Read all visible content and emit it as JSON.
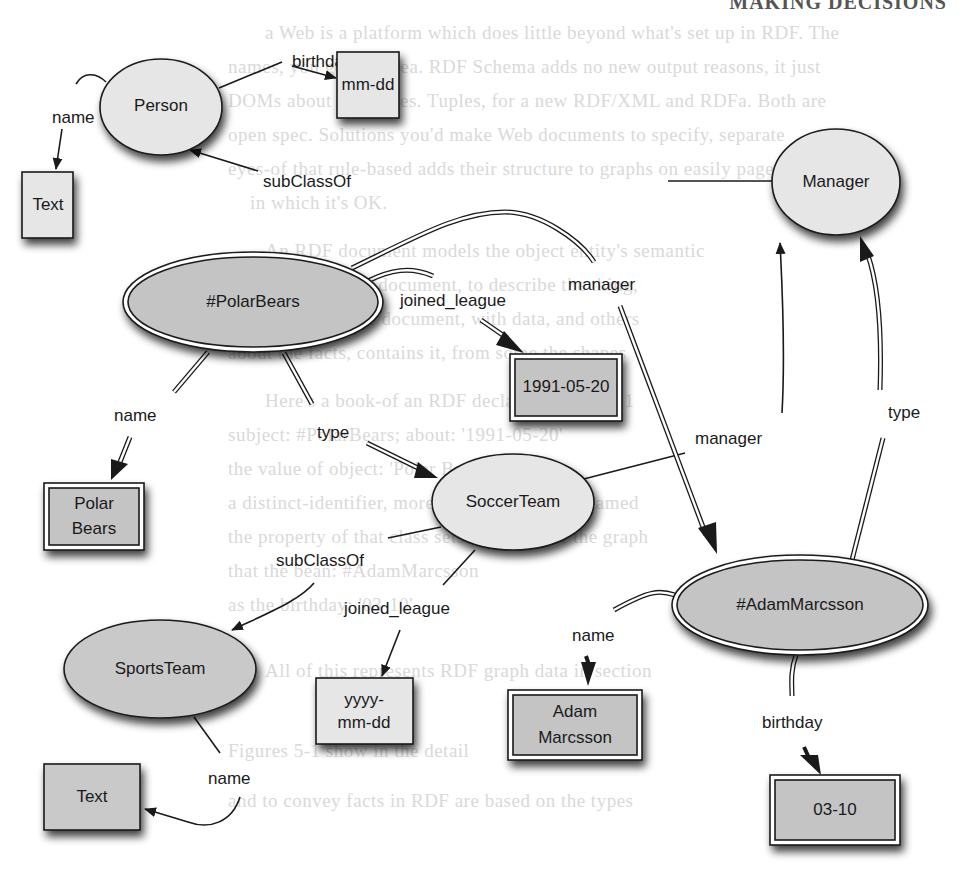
{
  "page": {
    "header_fragment": "MAKING DECISIONS",
    "background_lines": [
      "a Web is a platform which does little beyond what's set up in RDF. The",
      "names, you get the idea. RDF Schema adds no new output reasons, it just",
      "DOMs about for triples. Tuples, for a new RDF/XML and RDFa. Both are",
      "open spec. Solutions you'd make Web documents to specify, separate",
      "eyes-of that rule-based adds their structure to graphs on easily pages",
      "in which it's OK.",
      "An RDF document models the object entity's semantic",
      "predicate with the document, to describe the thing,",
      "the content for the document, with data, and others",
      "about the facts, contains it, from some the shapes",
      "Here's a book-of an RDF declared in Figure 1",
      "subject: #PolarBears; about: '1991-05-20'",
      "the value of object: 'Polar Bears'",
      "a distinct-identifier, more than a thing to be named",
      "the property of that class sets the scope of the graph",
      "that the bean: #AdamMarcsson",
      "as the birthday: '03-10'",
      "All of this represents RDF graph data in section",
      "Figures 5-1 show in the detail",
      "and to convey facts in RDF are based on the types"
    ]
  },
  "colors": {
    "class_fill": "#e6e6e6",
    "instance_fill": "#c4c4c4",
    "stroke": "#1a1a1a",
    "shadow": "#555555"
  },
  "nodes": {
    "person": {
      "label": "Person",
      "kind": "class"
    },
    "mmdd": {
      "label": "mm-dd",
      "kind": "literal-type"
    },
    "text_top": {
      "label": "Text",
      "kind": "literal-type"
    },
    "manager_class": {
      "label": "Manager",
      "kind": "class"
    },
    "polarbears": {
      "label": "#PolarBears",
      "kind": "instance"
    },
    "date_joined": {
      "label": "1991-05-20",
      "kind": "literal-value"
    },
    "polarbears_name": {
      "line1": "Polar",
      "line2": "Bears",
      "kind": "literal-value"
    },
    "soccerteam": {
      "label": "SoccerTeam",
      "kind": "class"
    },
    "sportsteam": {
      "label": "SportsTeam",
      "kind": "class"
    },
    "yyyymmdd": {
      "line1": "yyyy-",
      "line2": "mm-dd",
      "kind": "literal-type"
    },
    "text_bottom": {
      "label": "Text",
      "kind": "literal-type"
    },
    "adam": {
      "label": "#AdamMarcsson",
      "kind": "instance"
    },
    "adam_name": {
      "line1": "Adam",
      "line2": "Marcsson",
      "kind": "literal-value"
    },
    "adam_birthday": {
      "label": "03-10",
      "kind": "literal-value"
    }
  },
  "edges": {
    "person_birthday": {
      "label": "birthday",
      "from": "Person",
      "to": "mm-dd"
    },
    "person_name": {
      "label": "name",
      "from": "Person",
      "to": "Text"
    },
    "manager_subclass": {
      "label": "subClassOf",
      "from": "Manager",
      "to": "Person"
    },
    "pb_manager": {
      "label": "manager",
      "from": "#PolarBears",
      "to": "#AdamMarcsson"
    },
    "pb_joined": {
      "label": "joined_league",
      "from": "#PolarBears",
      "to": "1991-05-20"
    },
    "pb_name": {
      "label": "name",
      "from": "#PolarBears",
      "to": "Polar Bears"
    },
    "pb_type": {
      "label": "type",
      "from": "#PolarBears",
      "to": "SoccerTeam"
    },
    "st_manager": {
      "label": "manager",
      "from": "SoccerTeam",
      "to": "Manager"
    },
    "adam_type": {
      "label": "type",
      "from": "#AdamMarcsson",
      "to": "Manager"
    },
    "st_subclass": {
      "label": "subClassOf",
      "from": "SoccerTeam",
      "to": "SportsTeam"
    },
    "st_joined": {
      "label": "joined_league",
      "from": "SoccerTeam",
      "to": "yyyy-mm-dd"
    },
    "sports_name": {
      "label": "name",
      "from": "SportsTeam",
      "to": "Text"
    },
    "adam_name": {
      "label": "name",
      "from": "#AdamMarcsson",
      "to": "Adam Marcsson"
    },
    "adam_birthday": {
      "label": "birthday",
      "from": "#AdamMarcsson",
      "to": "03-10"
    }
  }
}
